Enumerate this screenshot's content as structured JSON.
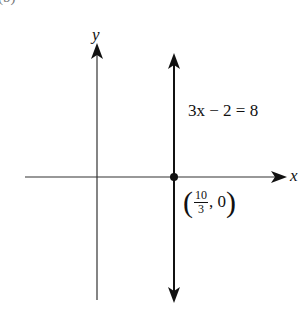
{
  "header_fragment": "(b)",
  "axes": {
    "x_label": "x",
    "y_label": "y"
  },
  "line": {
    "equation": "3x − 2 = 8",
    "type": "vertical"
  },
  "point": {
    "open": "(",
    "num": "10",
    "den": "3",
    "rest": ", 0",
    "close": ")"
  },
  "colors": {
    "axis": "#333333",
    "line": "#111111"
  }
}
